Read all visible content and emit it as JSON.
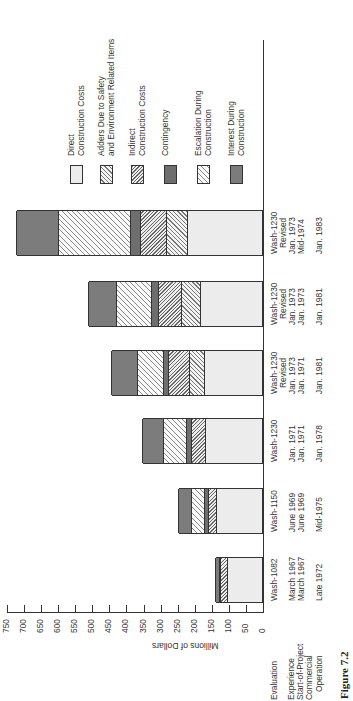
{
  "figure_label": "Figure 7.2",
  "axis": {
    "title": "Millions of Dollars",
    "ticks": [
      "750",
      "700",
      "650",
      "600",
      "550",
      "500",
      "450",
      "400",
      "350",
      "300",
      "250",
      "200",
      "150",
      "100",
      "50",
      "0"
    ]
  },
  "row_headers": {
    "evaluation": "Evaluation",
    "experience": "Experience",
    "start": "Start-of-Project",
    "commercial": "Commercial",
    "operation": "Operation",
    "colon": ":"
  },
  "legend": [
    {
      "key": "direct",
      "line1": "Direct",
      "line2": "Construction Costs"
    },
    {
      "key": "adders",
      "line1": "Adders Due to Safety",
      "line2": "and Environment Related Items"
    },
    {
      "key": "indirect",
      "line1": "Indirect",
      "line2": "Construction Costs"
    },
    {
      "key": "contingency",
      "line1": "Contingency",
      "line2": ""
    },
    {
      "key": "escalation",
      "line1": "Escalation During",
      "line2": "Construction"
    },
    {
      "key": "interest",
      "line1": "Interest During",
      "line2": "Construction"
    }
  ],
  "categories": [
    {
      "evaluation": "Wash-1082",
      "revised": "",
      "experience": "March 1967",
      "start": "March 1967",
      "operation": "Late 1972"
    },
    {
      "evaluation": "Wash-1150",
      "revised": "",
      "experience": "June 1969",
      "start": "June 1969",
      "operation": "Mid-1975"
    },
    {
      "evaluation": "Wash-1230",
      "revised": "",
      "experience": "Jan. 1971",
      "start": "Jan. 1971",
      "operation": "Jan. 1978"
    },
    {
      "evaluation": "Wash-1230",
      "revised": "Revised",
      "experience": "Jan. 1973",
      "start": "Jan. 1971",
      "operation": "Jan. 1981"
    },
    {
      "evaluation": "Wash-1230",
      "revised": "Revised",
      "experience": "Jan. 1973",
      "start": "Jan. 1973",
      "operation": "Jan. 1981"
    },
    {
      "evaluation": "Wash-1230",
      "revised": "Revised",
      "experience": "Jan. 1973",
      "start": "Mid-1974",
      "operation": "Jan. 1983"
    }
  ],
  "chart_data": {
    "type": "bar",
    "stacked": true,
    "orientation": "horizontal (figure rotated 90°)",
    "title": "Figure 7.2",
    "xlabel": "Millions of Dollars",
    "ylabel": "",
    "xlim": [
      0,
      750
    ],
    "categories": [
      "Wash-1082 (Mar 1967 / Late 1972)",
      "Wash-1150 (Jun 1969 / Mid-1975)",
      "Wash-1230 (Jan 1971 / Jan 1978)",
      "Wash-1230 Revised (Jan 1973, start Jan 1971 / Jan 1981)",
      "Wash-1230 Revised (Jan 1973, start Jan 1973 / Jan 1981)",
      "Wash-1230 Revised (Jan 1973, start Mid-1974 / Jan 1983)"
    ],
    "series": [
      {
        "name": "Direct Construction Costs",
        "values": [
          102,
          134,
          166,
          169,
          183,
          221
        ]
      },
      {
        "name": "Adders Due to Safety and Environment Related Items",
        "values": [
          0,
          0,
          0,
          44,
          55,
          61
        ]
      },
      {
        "name": "Indirect Construction Costs",
        "values": [
          20,
          23,
          41,
          61,
          67,
          76
        ]
      },
      {
        "name": "Contingency",
        "values": [
          4,
          12,
          17,
          15,
          20,
          29
        ]
      },
      {
        "name": "Escalation During Construction",
        "values": [
          0,
          38,
          67,
          76,
          102,
          212
        ]
      },
      {
        "name": "Interest During Construction",
        "values": [
          12,
          38,
          61,
          76,
          84,
          122
        ]
      }
    ],
    "totals": [
      138,
      245,
      352,
      441,
      511,
      721
    ],
    "grid": false,
    "legend_position": "top"
  },
  "colors": {
    "ink": "#333333",
    "direct": "#ececec",
    "contingency": "#6e6e6e",
    "interest": "#444444"
  }
}
